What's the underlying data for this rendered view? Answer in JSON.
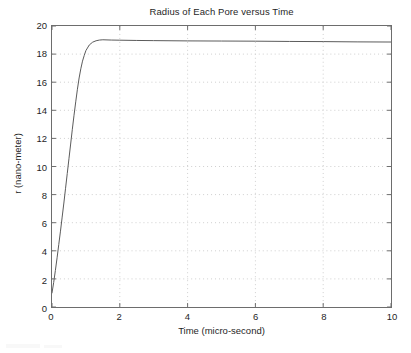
{
  "chart_data": {
    "type": "line",
    "title": "Radius of Each Pore versus Time",
    "xlabel": "Time  (micro-second)",
    "ylabel": "r  (nano-meter)",
    "xlim": [
      0,
      10
    ],
    "ylim": [
      0,
      20
    ],
    "xticks": [
      0,
      2,
      4,
      6,
      8,
      10
    ],
    "yticks": [
      0,
      2,
      4,
      6,
      8,
      10,
      12,
      14,
      16,
      18,
      20
    ],
    "xtick_labels": [
      "0",
      "2",
      "4",
      "6",
      "8",
      "10"
    ],
    "ytick_labels": [
      "0",
      "2",
      "4",
      "6",
      "8",
      "10",
      "12",
      "14",
      "16",
      "18",
      "20"
    ],
    "grid": true,
    "grid_style": "dotted",
    "grid_color": "#cfcfcf",
    "line_color": "#5a5a5a",
    "line_width": 1,
    "legend": null,
    "series": [
      {
        "name": "pore radius",
        "x": [
          0.0,
          0.05,
          0.1,
          0.15,
          0.2,
          0.25,
          0.3,
          0.35,
          0.4,
          0.45,
          0.5,
          0.55,
          0.6,
          0.65,
          0.7,
          0.75,
          0.8,
          0.85,
          0.9,
          0.95,
          1.0,
          1.1,
          1.2,
          1.3,
          1.4,
          1.5,
          1.75,
          2.0,
          2.5,
          3.0,
          4.0,
          5.0,
          6.0,
          7.0,
          8.0,
          9.0,
          10.0
        ],
        "y": [
          1.0,
          1.75,
          2.6,
          3.5,
          4.45,
          5.4,
          6.4,
          7.4,
          8.45,
          9.5,
          10.55,
          11.6,
          12.65,
          13.65,
          14.6,
          15.5,
          16.3,
          16.95,
          17.5,
          17.9,
          18.25,
          18.65,
          18.85,
          18.95,
          19.0,
          19.02,
          19.0,
          18.99,
          18.97,
          18.96,
          18.94,
          18.93,
          18.92,
          18.9,
          18.89,
          18.87,
          18.86
        ]
      }
    ]
  },
  "figure": {
    "title": "Radius of Each Pore versus Time",
    "xlabel": "Time  (micro-second)",
    "ylabel": "r  (nano-meter)"
  }
}
